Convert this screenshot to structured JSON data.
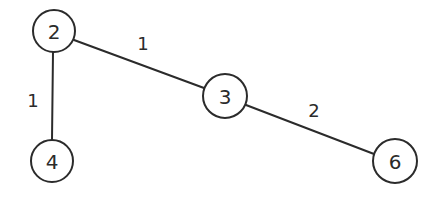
{
  "diagram": {
    "type": "weighted-graph",
    "background": "#ffffff",
    "stroke_color": "#2b2b2b",
    "nodes": [
      {
        "id": "2",
        "label": "2",
        "x": 54,
        "y": 31,
        "r": 21
      },
      {
        "id": "3",
        "label": "3",
        "x": 225,
        "y": 96,
        "r": 22
      },
      {
        "id": "4",
        "label": "4",
        "x": 52,
        "y": 161,
        "r": 21
      },
      {
        "id": "6",
        "label": "6",
        "x": 395,
        "y": 161,
        "r": 22
      }
    ],
    "edges": [
      {
        "from": "2",
        "to": "3",
        "weight": "1",
        "label_x": 143,
        "label_y": 43
      },
      {
        "from": "2",
        "to": "4",
        "weight": "1",
        "label_x": 33,
        "label_y": 100
      },
      {
        "from": "3",
        "to": "6",
        "weight": "2",
        "label_x": 314,
        "label_y": 110
      }
    ]
  }
}
